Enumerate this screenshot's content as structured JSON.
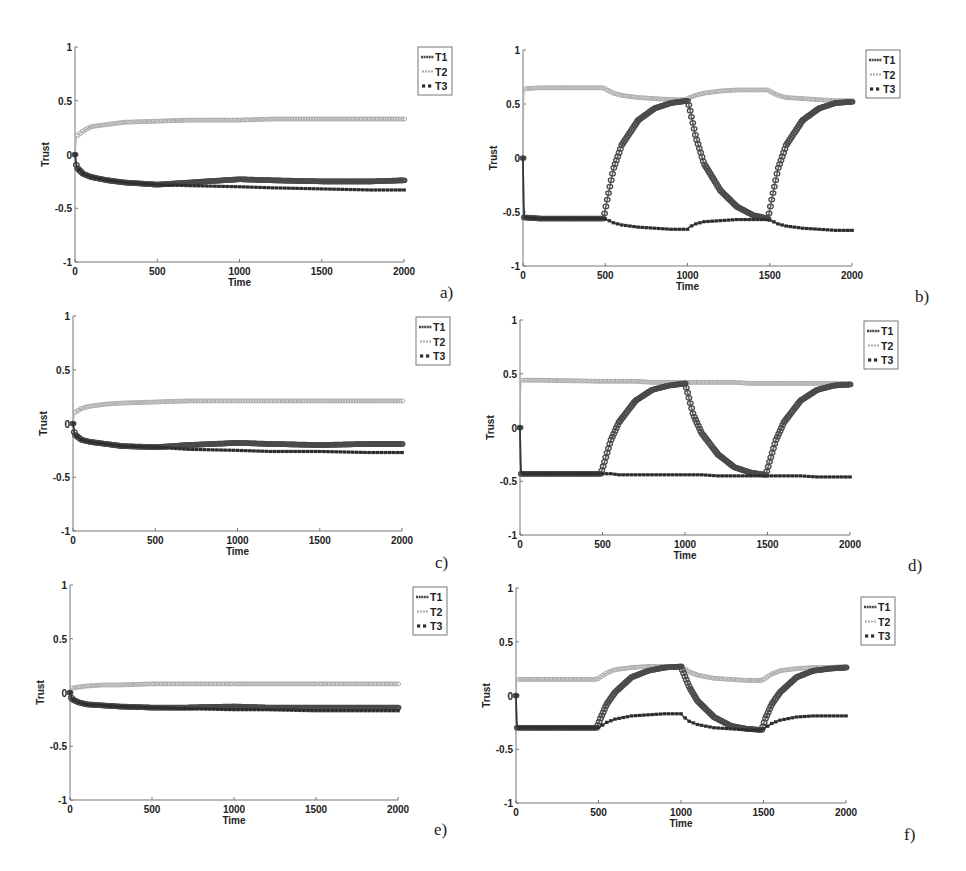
{
  "figure": {
    "legend_labels": [
      "T1",
      "T2",
      "T3"
    ],
    "xlabel": "Time",
    "ylabel": "Trust",
    "x_ticks": [
      "0",
      "500",
      "1000",
      "1500",
      "2000"
    ],
    "y_ticks": [
      "1",
      "0.5",
      "0",
      "-0.5",
      "-1"
    ],
    "colors": {
      "T1": "#4a4a4a",
      "T2": "#a8a8a8",
      "T3": "#2e2e2e",
      "axis": "#777777",
      "text": "#222222"
    }
  },
  "panels": [
    {
      "id": "a",
      "label": "a)"
    },
    {
      "id": "b",
      "label": "b)"
    },
    {
      "id": "c",
      "label": "c)"
    },
    {
      "id": "d",
      "label": "d)"
    },
    {
      "id": "e",
      "label": "e)"
    },
    {
      "id": "f",
      "label": "f)"
    }
  ],
  "chart_data": [
    {
      "panel": "a)",
      "type": "line",
      "title": "",
      "xlabel": "Time",
      "ylabel": "Trust",
      "xlim": [
        0,
        2000
      ],
      "ylim": [
        -1,
        1
      ],
      "grid": false,
      "legend_position": "top-right-outside",
      "x": [
        0,
        10,
        50,
        100,
        200,
        300,
        500,
        700,
        1000,
        1200,
        1500,
        1800,
        2000
      ],
      "series": [
        {
          "name": "T1",
          "values": [
            0,
            -0.12,
            -0.18,
            -0.21,
            -0.24,
            -0.26,
            -0.28,
            -0.26,
            -0.23,
            -0.24,
            -0.25,
            -0.25,
            -0.24
          ]
        },
        {
          "name": "T2",
          "values": [
            0,
            0.17,
            0.22,
            0.26,
            0.28,
            0.3,
            0.31,
            0.32,
            0.32,
            0.33,
            0.33,
            0.33,
            0.33
          ]
        },
        {
          "name": "T3",
          "values": [
            0,
            -0.12,
            -0.18,
            -0.21,
            -0.24,
            -0.26,
            -0.28,
            -0.29,
            -0.3,
            -0.31,
            -0.32,
            -0.33,
            -0.33
          ]
        }
      ]
    },
    {
      "panel": "b)",
      "type": "line",
      "title": "",
      "xlabel": "Time",
      "ylabel": "Trust",
      "xlim": [
        0,
        2000
      ],
      "ylim": [
        -1,
        1
      ],
      "grid": false,
      "legend_position": "top-right-outside",
      "x": [
        0,
        5,
        100,
        490,
        510,
        550,
        600,
        700,
        800,
        900,
        1000,
        1010,
        1050,
        1100,
        1200,
        1300,
        1400,
        1490,
        1510,
        1550,
        1600,
        1700,
        1800,
        1900,
        2000
      ],
      "series": [
        {
          "name": "T1",
          "values": [
            0,
            -0.55,
            -0.56,
            -0.56,
            -0.4,
            -0.1,
            0.12,
            0.35,
            0.46,
            0.51,
            0.53,
            0.48,
            0.2,
            -0.05,
            -0.3,
            -0.45,
            -0.53,
            -0.56,
            -0.4,
            -0.1,
            0.12,
            0.35,
            0.46,
            0.51,
            0.52
          ]
        },
        {
          "name": "T2",
          "values": [
            0,
            0.64,
            0.65,
            0.65,
            0.63,
            0.6,
            0.58,
            0.56,
            0.55,
            0.54,
            0.54,
            0.56,
            0.58,
            0.6,
            0.62,
            0.63,
            0.63,
            0.63,
            0.61,
            0.58,
            0.56,
            0.55,
            0.54,
            0.53,
            0.53
          ]
        },
        {
          "name": "T3",
          "values": [
            0,
            -0.55,
            -0.56,
            -0.56,
            -0.57,
            -0.6,
            -0.62,
            -0.64,
            -0.65,
            -0.66,
            -0.66,
            -0.64,
            -0.61,
            -0.59,
            -0.58,
            -0.57,
            -0.57,
            -0.57,
            -0.58,
            -0.61,
            -0.63,
            -0.65,
            -0.66,
            -0.67,
            -0.67
          ]
        }
      ]
    },
    {
      "panel": "c)",
      "type": "line",
      "title": "",
      "xlabel": "Time",
      "ylabel": "Trust",
      "xlim": [
        0,
        2000
      ],
      "ylim": [
        -1,
        1
      ],
      "grid": false,
      "legend_position": "top-right-outside",
      "x": [
        0,
        10,
        50,
        100,
        200,
        300,
        500,
        700,
        1000,
        1200,
        1500,
        1800,
        2000
      ],
      "series": [
        {
          "name": "T1",
          "values": [
            0,
            -0.1,
            -0.15,
            -0.17,
            -0.19,
            -0.21,
            -0.22,
            -0.2,
            -0.18,
            -0.19,
            -0.2,
            -0.19,
            -0.19
          ]
        },
        {
          "name": "T2",
          "values": [
            0,
            0.1,
            0.14,
            0.16,
            0.18,
            0.19,
            0.2,
            0.21,
            0.21,
            0.21,
            0.21,
            0.21,
            0.21
          ]
        },
        {
          "name": "T3",
          "values": [
            0,
            -0.1,
            -0.15,
            -0.17,
            -0.19,
            -0.21,
            -0.22,
            -0.24,
            -0.25,
            -0.26,
            -0.26,
            -0.27,
            -0.27
          ]
        }
      ]
    },
    {
      "panel": "d)",
      "type": "line",
      "title": "",
      "xlabel": "Time",
      "ylabel": "Trust",
      "xlim": [
        0,
        2000
      ],
      "ylim": [
        -1,
        1
      ],
      "grid": false,
      "legend_position": "top-right-outside",
      "x": [
        0,
        5,
        100,
        490,
        510,
        550,
        600,
        700,
        800,
        900,
        1000,
        1010,
        1050,
        1100,
        1200,
        1300,
        1400,
        1490,
        1510,
        1550,
        1600,
        1700,
        1800,
        1900,
        2000
      ],
      "series": [
        {
          "name": "T1",
          "values": [
            0,
            -0.43,
            -0.43,
            -0.43,
            -0.33,
            -0.12,
            0.05,
            0.25,
            0.35,
            0.39,
            0.41,
            0.36,
            0.12,
            -0.05,
            -0.25,
            -0.37,
            -0.42,
            -0.44,
            -0.33,
            -0.12,
            0.05,
            0.25,
            0.35,
            0.39,
            0.4
          ]
        },
        {
          "name": "T2",
          "values": [
            0,
            0.44,
            0.44,
            0.43,
            0.43,
            0.43,
            0.43,
            0.43,
            0.42,
            0.42,
            0.42,
            0.42,
            0.42,
            0.42,
            0.42,
            0.42,
            0.41,
            0.41,
            0.41,
            0.41,
            0.41,
            0.41,
            0.41,
            0.41,
            0.41
          ]
        },
        {
          "name": "T3",
          "values": [
            0,
            -0.43,
            -0.43,
            -0.43,
            -0.43,
            -0.43,
            -0.44,
            -0.44,
            -0.44,
            -0.44,
            -0.44,
            -0.44,
            -0.44,
            -0.44,
            -0.45,
            -0.45,
            -0.45,
            -0.45,
            -0.45,
            -0.45,
            -0.45,
            -0.45,
            -0.46,
            -0.46,
            -0.46
          ]
        }
      ]
    },
    {
      "panel": "e)",
      "type": "line",
      "title": "",
      "xlabel": "Time",
      "ylabel": "Trust",
      "xlim": [
        0,
        2000
      ],
      "ylim": [
        -1,
        1
      ],
      "grid": false,
      "legend_position": "top-right-outside",
      "x": [
        0,
        10,
        50,
        100,
        200,
        300,
        500,
        700,
        1000,
        1200,
        1500,
        1800,
        2000
      ],
      "series": [
        {
          "name": "T1",
          "values": [
            0,
            -0.06,
            -0.09,
            -0.11,
            -0.12,
            -0.13,
            -0.14,
            -0.14,
            -0.13,
            -0.14,
            -0.14,
            -0.14,
            -0.14
          ]
        },
        {
          "name": "T2",
          "values": [
            0,
            0.04,
            0.05,
            0.06,
            0.07,
            0.07,
            0.08,
            0.08,
            0.08,
            0.08,
            0.08,
            0.08,
            0.08
          ]
        },
        {
          "name": "T3",
          "values": [
            0,
            -0.06,
            -0.09,
            -0.11,
            -0.12,
            -0.13,
            -0.14,
            -0.15,
            -0.16,
            -0.16,
            -0.17,
            -0.17,
            -0.17
          ]
        }
      ]
    },
    {
      "panel": "f)",
      "type": "line",
      "title": "",
      "xlabel": "Time",
      "ylabel": "Trust",
      "xlim": [
        0,
        2000
      ],
      "ylim": [
        -1,
        1
      ],
      "grid": false,
      "legend_position": "top-right-outside",
      "x": [
        0,
        5,
        100,
        490,
        510,
        550,
        600,
        700,
        800,
        900,
        1000,
        1010,
        1050,
        1100,
        1200,
        1300,
        1400,
        1490,
        1510,
        1550,
        1600,
        1700,
        1800,
        1900,
        2000
      ],
      "series": [
        {
          "name": "T1",
          "values": [
            0,
            -0.3,
            -0.3,
            -0.3,
            -0.22,
            -0.08,
            0.03,
            0.17,
            0.23,
            0.26,
            0.27,
            0.23,
            0.08,
            -0.05,
            -0.2,
            -0.28,
            -0.31,
            -0.32,
            -0.22,
            -0.08,
            0.03,
            0.17,
            0.23,
            0.25,
            0.26
          ]
        },
        {
          "name": "T2",
          "values": [
            0,
            0.15,
            0.15,
            0.15,
            0.17,
            0.21,
            0.24,
            0.26,
            0.27,
            0.27,
            0.27,
            0.26,
            0.22,
            0.19,
            0.16,
            0.15,
            0.14,
            0.14,
            0.16,
            0.2,
            0.23,
            0.25,
            0.26,
            0.26,
            0.27
          ]
        },
        {
          "name": "T3",
          "values": [
            0,
            -0.3,
            -0.3,
            -0.3,
            -0.29,
            -0.25,
            -0.22,
            -0.19,
            -0.18,
            -0.17,
            -0.17,
            -0.19,
            -0.24,
            -0.27,
            -0.3,
            -0.31,
            -0.32,
            -0.32,
            -0.3,
            -0.26,
            -0.23,
            -0.2,
            -0.19,
            -0.19,
            -0.19
          ]
        }
      ]
    }
  ]
}
